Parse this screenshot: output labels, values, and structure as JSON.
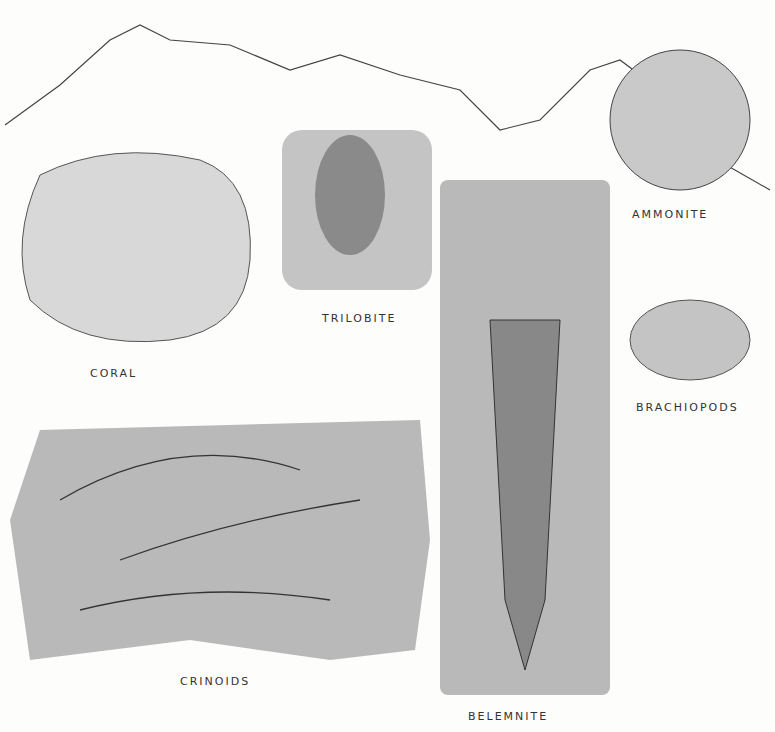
{
  "plate": {
    "labels": {
      "coral": "CORAL",
      "trilobite": "TRILOBITE",
      "ammonite": "AMMONITE",
      "brachiopods": "BRACHIOPODS",
      "crinoids": "CRINOIDS",
      "belemnite": "BELEMNITE"
    },
    "colors": {
      "panel_gray": "#b9b9b9",
      "ink": "#333333",
      "paper": "#fdfdfc"
    }
  }
}
